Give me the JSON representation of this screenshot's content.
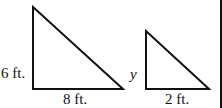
{
  "figure": {
    "large_triangle": {
      "height_label": "6 ft.",
      "base_label": "8 ft."
    },
    "small_triangle": {
      "height_label": "y",
      "base_label": "2 ft."
    },
    "colors": {
      "stroke": "#111111",
      "background": "#ffffff"
    }
  }
}
